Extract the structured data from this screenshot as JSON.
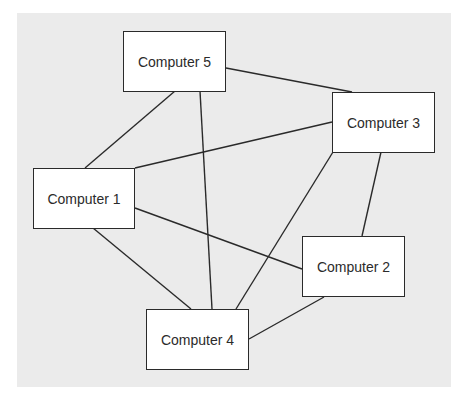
{
  "diagram": {
    "type": "network-topology",
    "background_color": "#ebebeb",
    "line_color": "#2a2a2a",
    "nodes": [
      {
        "id": "c5",
        "label": "Computer 5",
        "x": 123,
        "y": 31,
        "w": 103,
        "h": 61
      },
      {
        "id": "c3",
        "label": "Computer 3",
        "x": 332,
        "y": 92,
        "w": 103,
        "h": 61
      },
      {
        "id": "c1",
        "label": "Computer 1",
        "x": 33,
        "y": 168,
        "w": 102,
        "h": 61
      },
      {
        "id": "c2",
        "label": "Computer 2",
        "x": 302,
        "y": 236,
        "w": 103,
        "h": 61
      },
      {
        "id": "c4",
        "label": "Computer 4",
        "x": 146,
        "y": 309,
        "w": 103,
        "h": 61
      }
    ],
    "edges": [
      {
        "from": "Computer 5",
        "to": "Computer 3",
        "x1": 226,
        "y1": 68,
        "x2": 352,
        "y2": 92
      },
      {
        "from": "Computer 5",
        "to": "Computer 1",
        "x1": 175,
        "y1": 91,
        "x2": 85,
        "y2": 168
      },
      {
        "from": "Computer 5",
        "to": "Computer 4",
        "x1": 200,
        "y1": 91,
        "x2": 212,
        "y2": 309
      },
      {
        "from": "Computer 1",
        "to": "Computer 3",
        "x1": 135,
        "y1": 168,
        "x2": 332,
        "y2": 122
      },
      {
        "from": "Computer 1",
        "to": "Computer 2",
        "x1": 135,
        "y1": 208,
        "x2": 302,
        "y2": 269
      },
      {
        "from": "Computer 1",
        "to": "Computer 4",
        "x1": 93,
        "y1": 228,
        "x2": 191,
        "y2": 309
      },
      {
        "from": "Computer 3",
        "to": "Computer 4",
        "x1": 333,
        "y1": 152,
        "x2": 236,
        "y2": 309
      },
      {
        "from": "Computer 3",
        "to": "Computer 2",
        "x1": 381,
        "y1": 152,
        "x2": 362,
        "y2": 236
      },
      {
        "from": "Computer 2",
        "to": "Computer 4",
        "x1": 324,
        "y1": 297,
        "x2": 249,
        "y2": 339
      }
    ]
  }
}
